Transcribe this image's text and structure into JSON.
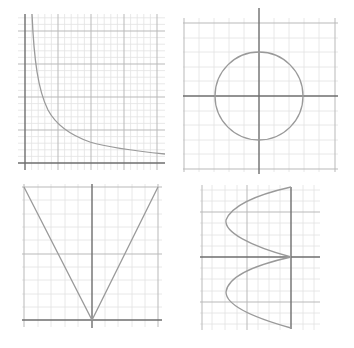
{
  "colors": {
    "minor_grid": "#e2e2e2",
    "major_grid": "#b9b9b9",
    "axis": "#6e6e6e",
    "curve": "#9a9a9a",
    "background": "#ffffff"
  },
  "graphs": [
    {
      "id": "reciprocal",
      "description": "Hyperbola y = 1/x in first quadrant"
    },
    {
      "id": "circle",
      "description": "Circle centered at origin"
    },
    {
      "id": "absolute-value",
      "description": "V-shaped graph y = |x|"
    },
    {
      "id": "sideways-sine",
      "description": "Curve x = -|sin y| opening left"
    }
  ]
}
